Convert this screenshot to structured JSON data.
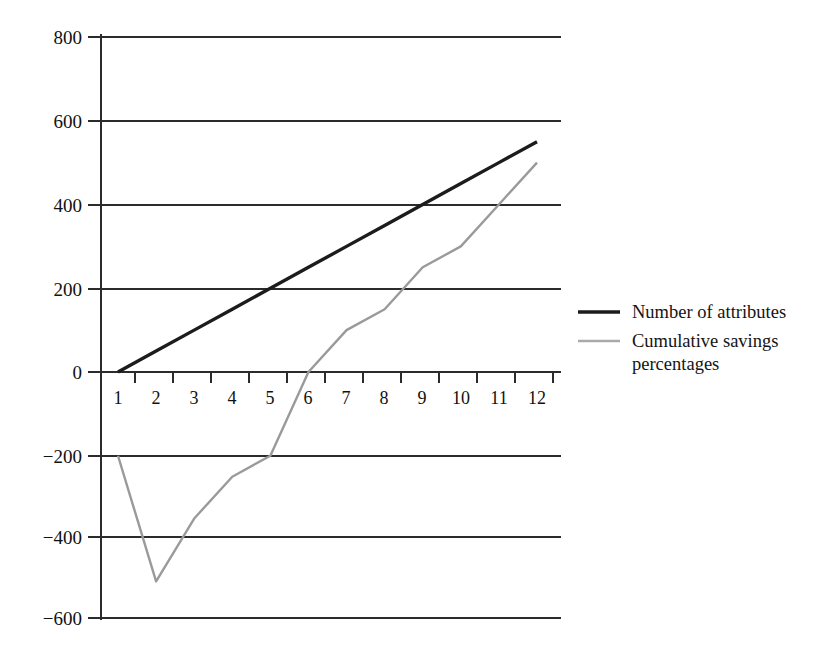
{
  "chart_data": {
    "type": "line",
    "title": "",
    "subtitle": "",
    "xlabel": "",
    "ylabel": "",
    "xlim": [
      1,
      12
    ],
    "ylim": [
      -600,
      800
    ],
    "grid": true,
    "grid_axis": "y",
    "legend_position": "right",
    "x": [
      1,
      2,
      3,
      4,
      5,
      6,
      7,
      8,
      9,
      10,
      11,
      12
    ],
    "x_tick_labels": [
      "1",
      "2",
      "3",
      "4",
      "5",
      "6",
      "7",
      "8",
      "9",
      "10",
      "11",
      "12"
    ],
    "y_tick_labels": [
      "800",
      "600",
      "400",
      "200",
      "0",
      "−200",
      "−400",
      "−600"
    ],
    "y_ticks": [
      800,
      600,
      400,
      200,
      0,
      -200,
      -400,
      -600
    ],
    "series": [
      {
        "name": "Number of attributes",
        "color": "#1c1c1c",
        "values": [
          0,
          50,
          100,
          150,
          200,
          250,
          300,
          350,
          400,
          450,
          500,
          550
        ]
      },
      {
        "name": "Cumulative savings percentages",
        "color": "#9a9a9a",
        "values": [
          -200,
          -500,
          -350,
          -250,
          -200,
          0,
          100,
          150,
          250,
          300,
          400,
          500
        ]
      }
    ]
  },
  "legend": {
    "items": [
      {
        "label": "Number of attributes",
        "color": "#1c1c1c"
      },
      {
        "label": "Cumulative savings percentages",
        "color": "#9a9a9a"
      }
    ],
    "item_0_label": "Number of attributes",
    "item_1_label_line1": "Cumulative savings",
    "item_1_label_line2": "percentages"
  },
  "axis": {
    "y_labels": {
      "t800": "800",
      "t600": "600",
      "t400": "400",
      "t200": "200",
      "t0": "0",
      "tm200": "−200",
      "tm400": "−400",
      "tm600": "−600"
    },
    "x_labels": {
      "x1": "1",
      "x2": "2",
      "x3": "3",
      "x4": "4",
      "x5": "5",
      "x6": "6",
      "x7": "7",
      "x8": "8",
      "x9": "9",
      "x10": "10",
      "x11": "11",
      "x12": "12"
    }
  }
}
